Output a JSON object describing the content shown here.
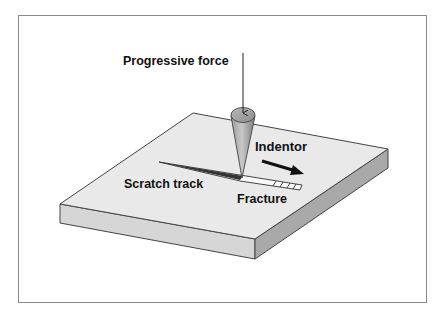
{
  "diagram": {
    "labels": {
      "force": "Progressive force",
      "indentor": "Indentor",
      "scratch_track": "Scratch track",
      "fracture": "Fracture"
    },
    "colors": {
      "frame_border": "#8a8a8a",
      "slab_top": "#e8e8e8",
      "slab_front_left": "#d4d4d4",
      "slab_front_right": "#a8a8a8",
      "outline": "#444444",
      "cone_light": "#bdbdbd",
      "cone_dark": "#8c8c8c",
      "text": "#111111"
    },
    "elements": [
      {
        "id": "slab",
        "type": "rectangular plate (isometric)"
      },
      {
        "id": "indentor",
        "type": "cone",
        "direction": "moving right"
      },
      {
        "id": "force-arrow",
        "type": "vertical arrow pointing down"
      },
      {
        "id": "motion-arrow",
        "type": "bold arrow pointing down-right"
      },
      {
        "id": "scratch-track",
        "type": "tapered groove widening toward fracture"
      },
      {
        "id": "fracture-zone",
        "type": "hatched segment at end of track"
      }
    ]
  }
}
